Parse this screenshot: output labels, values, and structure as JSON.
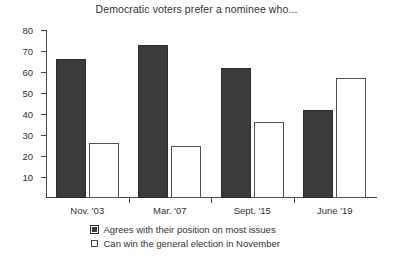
{
  "chart_data": {
    "type": "bar",
    "title": "Democratic voters prefer a nominee who...",
    "xlabel": "",
    "ylabel": "",
    "ylim": [
      0,
      80
    ],
    "yticks": [
      10,
      20,
      30,
      40,
      50,
      60,
      70,
      80
    ],
    "grid": false,
    "legend_position": "bottom",
    "categories": [
      "Nov. '03",
      "Mar. '07",
      "Sept. '15",
      "June '19"
    ],
    "series": [
      {
        "name": "Agrees with their position on most issues",
        "color": "#3b3b3b",
        "values": [
          66,
          73,
          62,
          42
        ]
      },
      {
        "name": "Can win the general election in November",
        "color": "#ffffff",
        "values": [
          26,
          25,
          36,
          57
        ]
      }
    ]
  }
}
